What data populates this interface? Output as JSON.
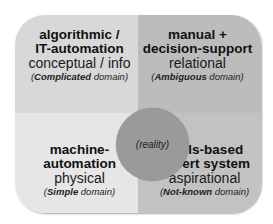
{
  "diagram": {
    "center": {
      "label": "(reality)"
    },
    "quadrants": [
      {
        "position": "top-left",
        "title_line1": "algorithmic /",
        "title_line2": "IT-automation",
        "subtitle": "conceptual / info",
        "domain_emph": "Complicated",
        "domain_rest": " domain",
        "color": "#d8d8d8"
      },
      {
        "position": "top-right",
        "title_line1": "manual +",
        "title_line2": "decision-support",
        "subtitle": "relational",
        "domain_emph": "Ambiguous",
        "domain_rest": " domain",
        "color": "#bcbcbc"
      },
      {
        "position": "bottom-left",
        "title_line1": "machine-",
        "title_line2": "automation",
        "subtitle": "physical",
        "domain_emph": "Simple",
        "domain_rest": " domain",
        "color": "#e6e6e6"
      },
      {
        "position": "bottom-right",
        "title_line1": "skills-based",
        "title_line2": "expert system",
        "subtitle": "aspirational",
        "domain_emph": "Not-known",
        "domain_rest": " domain",
        "color": "#c2c2c2"
      }
    ],
    "paren_open": "(",
    "paren_close": ")"
  }
}
